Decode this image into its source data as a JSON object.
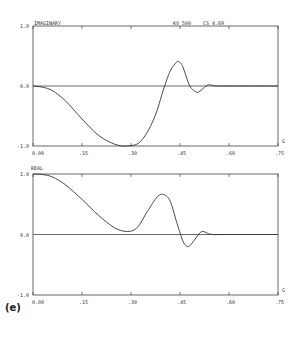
{
  "figure_label": "(e)",
  "chart_data": [
    {
      "type": "line",
      "title": "IMAGINARY",
      "header_params": [
        "KV  500",
        "CS  4.69"
      ],
      "xlabel": "G",
      "ylabel": "",
      "xlim": [
        0.0,
        0.75
      ],
      "ylim": [
        -1.0,
        1.0
      ],
      "xticks": [
        0.0,
        0.15,
        0.3,
        0.45,
        0.6,
        0.75
      ],
      "xtick_labels": [
        "0.00",
        ".15",
        ".30",
        ".45",
        ".60",
        ".75"
      ],
      "yticks": [
        1.0,
        0.0,
        -1.0
      ],
      "ytick_labels": [
        "1.0",
        "0.0",
        "-1.0"
      ],
      "grid": false,
      "zero_line": true,
      "series": [
        {
          "name": "imaginary",
          "x": [
            0.0,
            0.03,
            0.06,
            0.1,
            0.15,
            0.2,
            0.25,
            0.29,
            0.33,
            0.37,
            0.4,
            0.42,
            0.44,
            0.45,
            0.46,
            0.48,
            0.5,
            0.51,
            0.53,
            0.54,
            0.56,
            0.6,
            0.75
          ],
          "y": [
            0.0,
            -0.02,
            -0.08,
            -0.25,
            -0.55,
            -0.82,
            -0.97,
            -1.0,
            -0.92,
            -0.55,
            -0.05,
            0.25,
            0.4,
            0.39,
            0.3,
            0.0,
            -0.1,
            -0.09,
            0.0,
            0.02,
            0.0,
            0.0,
            0.0
          ]
        }
      ]
    },
    {
      "type": "line",
      "title": "REAL",
      "xlabel": "G",
      "ylabel": "",
      "xlim": [
        0.0,
        0.75
      ],
      "ylim": [
        -1.0,
        1.0
      ],
      "xticks": [
        0.0,
        0.15,
        0.3,
        0.45,
        0.6,
        0.75
      ],
      "xtick_labels": [
        "0.00",
        ".15",
        ".30",
        ".45",
        ".60",
        ".75"
      ],
      "yticks": [
        1.0,
        0.0,
        -1.0
      ],
      "ytick_labels": [
        "1.0",
        "0.0",
        "-1.0"
      ],
      "grid": false,
      "zero_line": true,
      "series": [
        {
          "name": "real",
          "x": [
            0.0,
            0.03,
            0.06,
            0.1,
            0.15,
            0.2,
            0.25,
            0.29,
            0.32,
            0.35,
            0.38,
            0.4,
            0.42,
            0.44,
            0.46,
            0.475,
            0.49,
            0.51,
            0.52,
            0.535,
            0.55,
            0.6,
            0.75
          ],
          "y": [
            1.0,
            0.99,
            0.95,
            0.82,
            0.58,
            0.32,
            0.11,
            0.05,
            0.12,
            0.38,
            0.62,
            0.66,
            0.55,
            0.2,
            -0.12,
            -0.2,
            -0.12,
            0.02,
            0.05,
            0.02,
            0.0,
            0.0,
            0.0
          ]
        }
      ]
    }
  ]
}
